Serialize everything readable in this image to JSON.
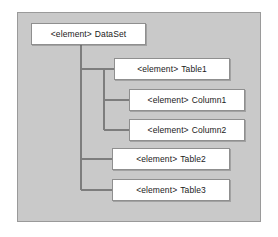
{
  "diagram": {
    "type": "tree",
    "background_color": "#ffffff",
    "panel_color": "#c9c9c9",
    "panel_border_color": "#9a9a9a",
    "node_fill_color": "#ffffff",
    "node_border_color": "#8f8f8f",
    "connector_color": "#7d7d7d",
    "nodes": [
      {
        "id": "dataset",
        "tag": "<element>",
        "name": "DataSet",
        "label": "<element> DataSet",
        "level": 0,
        "parent": null,
        "x": 31,
        "y": 23,
        "width": 115,
        "height": 22
      },
      {
        "id": "table1",
        "tag": "<element>",
        "name": "Table1",
        "label": "<element> Table1",
        "level": 1,
        "parent": "dataset",
        "x": 114,
        "y": 58,
        "width": 116,
        "height": 22
      },
      {
        "id": "column1",
        "tag": "<element>",
        "name": "Column1",
        "label": "<element> Column1",
        "level": 2,
        "parent": "table1",
        "x": 129,
        "y": 89,
        "width": 116,
        "height": 22
      },
      {
        "id": "column2",
        "tag": "<element>",
        "name": "Column2",
        "label": "<element> Column2",
        "level": 2,
        "parent": "table1",
        "x": 129,
        "y": 119,
        "width": 116,
        "height": 22
      },
      {
        "id": "table2",
        "tag": "<element>",
        "name": "Table2",
        "label": "<element> Table2",
        "level": 1,
        "parent": "dataset",
        "x": 112,
        "y": 148,
        "width": 118,
        "height": 22
      },
      {
        "id": "table3",
        "tag": "<element>",
        "name": "Table3",
        "label": "<element> Table3",
        "level": 1,
        "parent": "dataset",
        "x": 112,
        "y": 179,
        "width": 118,
        "height": 22
      }
    ],
    "edges": [
      {
        "id": "edge-dataset-table1",
        "from": "dataset",
        "to": "table1"
      },
      {
        "id": "edge-table1-column1",
        "from": "table1",
        "to": "column1"
      },
      {
        "id": "edge-table1-column2",
        "from": "table1",
        "to": "column2"
      },
      {
        "id": "edge-dataset-table2",
        "from": "dataset",
        "to": "table2"
      },
      {
        "id": "edge-dataset-table3",
        "from": "dataset",
        "to": "table3"
      }
    ],
    "trunks": [
      {
        "id": "trunk-dataset",
        "x": 81,
        "y_top": 45,
        "y_bottom": 190
      },
      {
        "id": "trunk-table1",
        "x": 104,
        "y_top": 69,
        "y_bottom": 130
      }
    ]
  }
}
